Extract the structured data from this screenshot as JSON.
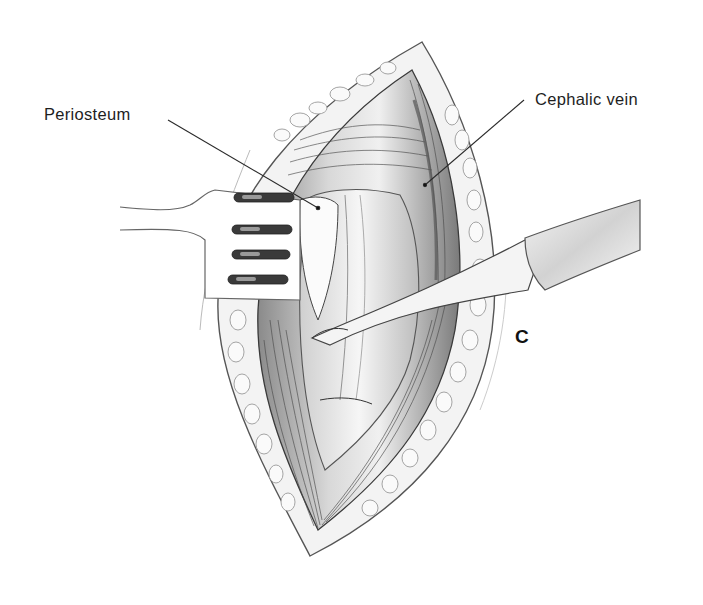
{
  "figure": {
    "type": "surgical-illustration",
    "panel_letter": "C",
    "colors": {
      "background": "#ffffff",
      "ink": "#2a2a2a",
      "tissue_light": "#e9e9e9",
      "tissue_mid": "#bdbdbd",
      "tissue_dark": "#6a6a6a",
      "fat_lobule": "#f7f7f7"
    },
    "labels": [
      {
        "id": "periosteum",
        "text": "Periosteum",
        "leader_from": [
          168,
          120
        ],
        "leader_to": [
          318,
          208
        ]
      },
      {
        "id": "cephalic_vein",
        "text": "Cephalic vein",
        "leader_from": [
          524,
          100
        ],
        "leader_to": [
          425,
          185
        ]
      }
    ],
    "instruments": [
      {
        "id": "rake-retractor",
        "name": "Rake retractor",
        "prongs": 4,
        "side": "left"
      },
      {
        "id": "periosteal-elevator",
        "name": "Periosteal elevator",
        "side": "right"
      }
    ],
    "structures": [
      "incision",
      "subcutaneous-fat",
      "deltoid-muscle-fibers",
      "humeral-shaft",
      "periosteum",
      "cephalic-vein",
      "pectoralis-fibers"
    ]
  }
}
